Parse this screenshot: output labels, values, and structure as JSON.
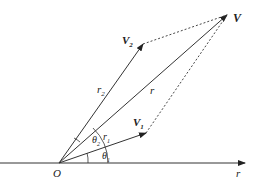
{
  "diagram": {
    "origin_label": "O",
    "axis_label": "r",
    "vectors": [
      {
        "name": "V",
        "label": "V",
        "magnitude_label": "r"
      },
      {
        "name": "V1",
        "label": "V",
        "subscript": "1",
        "magnitude_label": "r",
        "magnitude_subscript": "1",
        "angle_label": "θ",
        "angle_subscript": "1"
      },
      {
        "name": "V2",
        "label": "V",
        "subscript": "2",
        "magnitude_label": "r",
        "magnitude_subscript": "2",
        "angle_label": "θ",
        "angle_subscript": "2"
      }
    ],
    "colors": {
      "line": "#333333",
      "background": "#ffffff"
    }
  }
}
